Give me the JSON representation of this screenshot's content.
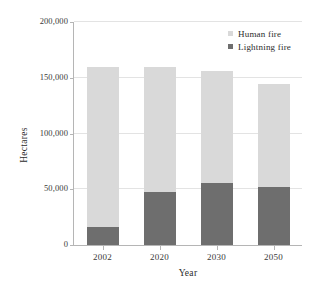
{
  "chart_data": {
    "type": "bar",
    "subtype": "stacked-vertical",
    "title": "",
    "xlabel": "Year",
    "ylabel": "Hectares",
    "categories": [
      "2002",
      "2020",
      "2030",
      "2050"
    ],
    "series": [
      {
        "name": "Lightning fire",
        "color": "#6e6e6e",
        "values": [
          16100,
          47500,
          55600,
          52000
        ]
      },
      {
        "name": "Human fire",
        "color": "#d9d9d9",
        "values": [
          143500,
          112100,
          100500,
          92400
        ]
      }
    ],
    "totals": [
      159600,
      159600,
      156100,
      144400
    ],
    "ylim": [
      0,
      200000
    ],
    "ytick_values": [
      0,
      50000,
      100000,
      150000,
      200000
    ],
    "ytick_labels": [
      "0",
      "50,000",
      "100,000",
      "150,000",
      "200,000"
    ],
    "grid": true,
    "grid_axis": "y",
    "legend_position": "top-right",
    "legend_entries": [
      "Human fire",
      "Lightning fire"
    ],
    "stack_order_bottom_to_top": [
      "Lightning fire",
      "Human fire"
    ]
  },
  "axes": {
    "y_title": "Hectares",
    "x_title": "Year"
  },
  "legend": {
    "items": [
      {
        "label": "Human fire",
        "color": "#d9d9d9"
      },
      {
        "label": "Lightning fire",
        "color": "#6e6e6e"
      }
    ]
  },
  "colors": {
    "human_fire": "#d9d9d9",
    "lightning_fire": "#6e6e6e",
    "grid": "#e3e3e3",
    "axis": "#b5b5b5",
    "text": "#2c2c2c",
    "background": "#ffffff"
  }
}
